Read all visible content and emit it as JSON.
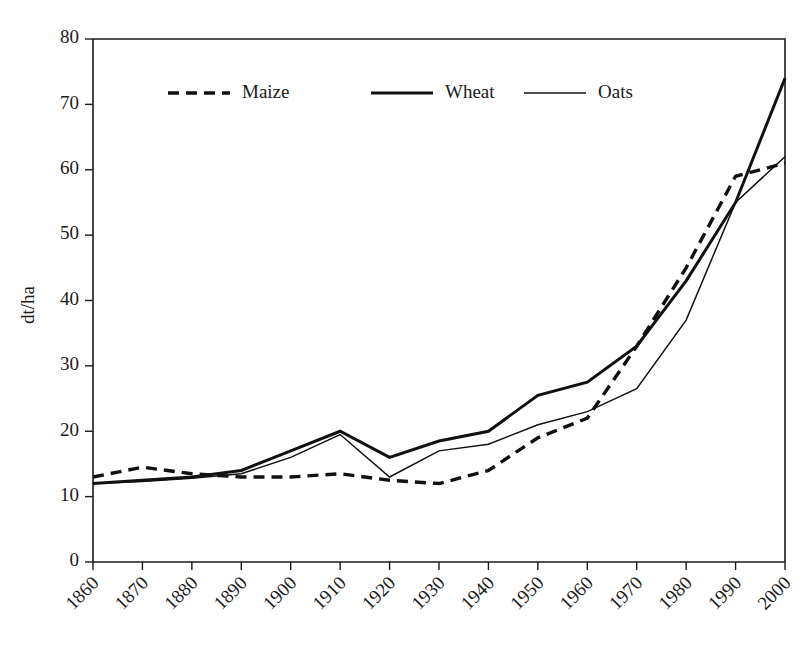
{
  "chart_data": {
    "type": "line",
    "title": "",
    "subtitle": "",
    "xlabel": "",
    "ylabel": "dt/ha",
    "x": [
      1860,
      1870,
      1880,
      1890,
      1900,
      1910,
      1920,
      1930,
      1940,
      1950,
      1960,
      1970,
      1980,
      1990,
      2000
    ],
    "xtick_labels": [
      "1860",
      "1870",
      "1880",
      "1890",
      "1900",
      "1910",
      "1920",
      "1930",
      "1940",
      "1950",
      "1960",
      "1970",
      "1980",
      "1990",
      "2000"
    ],
    "ytick_labels": [
      "0",
      "10",
      "20",
      "30",
      "40",
      "50",
      "60",
      "70",
      "80"
    ],
    "ytick_values": [
      0,
      10,
      20,
      30,
      40,
      50,
      60,
      70,
      80
    ],
    "xlim": [
      1860,
      2000
    ],
    "ylim": [
      0,
      80
    ],
    "grid": false,
    "legend_position": "top-center-inside",
    "series": [
      {
        "name": "Maize",
        "style": "dashed-thick",
        "color": "#111111",
        "values": [
          13.0,
          14.5,
          13.5,
          13.0,
          13.0,
          13.5,
          12.5,
          12.0,
          14.0,
          19.0,
          22.0,
          33.0,
          45.0,
          59.0,
          61.0
        ]
      },
      {
        "name": "Wheat",
        "style": "solid-thick",
        "color": "#111111",
        "values": [
          12.0,
          12.5,
          13.0,
          14.0,
          17.0,
          20.0,
          16.0,
          18.5,
          20.0,
          25.5,
          27.5,
          33.0,
          43.0,
          55.0,
          74.0
        ]
      },
      {
        "name": "Oats",
        "style": "solid-thin",
        "color": "#111111",
        "values": [
          12.0,
          12.3,
          12.8,
          13.5,
          16.0,
          19.5,
          13.0,
          17.0,
          18.0,
          21.0,
          23.0,
          26.5,
          37.0,
          55.0,
          62.0
        ]
      }
    ]
  },
  "legend": {
    "items": [
      {
        "label": "Maize",
        "style": "dashed-thick"
      },
      {
        "label": "Wheat",
        "style": "solid-thick"
      },
      {
        "label": "Oats",
        "style": "solid-thin"
      }
    ]
  },
  "axes": {
    "y_title": "dt/ha"
  }
}
